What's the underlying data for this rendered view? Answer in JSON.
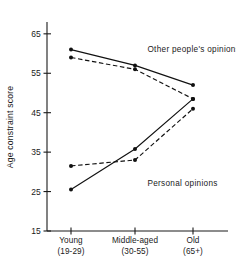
{
  "chart_data": {
    "type": "line",
    "title": "",
    "xlabel": "",
    "ylabel": "Age constraint score",
    "categories": [
      "Young\n(19-29)",
      "Middle-aged\n(30-55)",
      "Old\n(65+)"
    ],
    "category_labels": [
      {
        "line1": "Young",
        "line2": "(19-29)"
      },
      {
        "line1": "Middle-aged",
        "line2": "(30-55)"
      },
      {
        "line1": "Old",
        "line2": "(65+)"
      }
    ],
    "x": [
      1,
      2,
      3
    ],
    "ylim": [
      15,
      68
    ],
    "yticks": [
      65,
      55,
      45,
      35,
      25,
      15
    ],
    "ytick_labels": [
      "65",
      "55",
      "45",
      "35",
      "25",
      "15"
    ],
    "grid": false,
    "legend": "annotations-inline",
    "annotations": [
      {
        "text": "Other people's opinions",
        "x_frac": 0.555,
        "y_value": 60.5
      },
      {
        "text": "Personal opinions",
        "x_frac": 0.555,
        "y_value": 26.5
      }
    ],
    "series": [
      {
        "name": "Other people's opinions - solid",
        "style": "solid",
        "group": "other",
        "values": [
          61.0,
          57.0,
          52.0
        ]
      },
      {
        "name": "Other people's opinions - dashed",
        "style": "dashed",
        "group": "other",
        "values": [
          59.0,
          56.0,
          48.5
        ]
      },
      {
        "name": "Personal opinions - solid",
        "style": "solid",
        "group": "personal",
        "values": [
          25.5,
          35.8,
          48.5
        ]
      },
      {
        "name": "Personal opinions - dashed",
        "style": "dashed",
        "group": "personal",
        "values": [
          31.5,
          33.0,
          46.0
        ]
      }
    ],
    "colors": {
      "line": "#111111",
      "marker": "#111111",
      "axis": "#1a1a1a",
      "background": "#ffffff"
    }
  }
}
